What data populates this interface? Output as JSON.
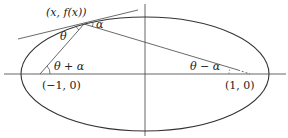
{
  "diagram": {
    "type": "ellipse-reflection",
    "labels": {
      "point": "(x, f(x))",
      "alpha": "α",
      "theta": "θ",
      "theta_plus_alpha": "θ + α",
      "theta_minus_alpha": "θ − α",
      "left_focus": "(−1, 0)",
      "right_focus": "(1, 0)"
    },
    "colors": {
      "stroke": "#333333",
      "axis": "#555555",
      "background": "#ffffff"
    }
  }
}
